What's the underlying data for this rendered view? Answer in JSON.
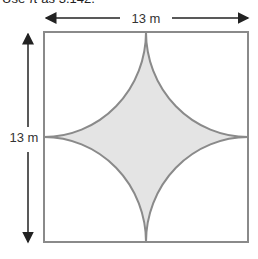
{
  "header": {
    "text": "Use π as 3.142."
  },
  "diagram": {
    "width_label": "13 m",
    "height_label": "13 m",
    "shape": "square with four quarter-circle arcs from each corner forming a shaded concave star",
    "colors": {
      "stroke": "#8a8a8a",
      "shaded": "#e4e4e4",
      "arrow": "#222222"
    }
  }
}
